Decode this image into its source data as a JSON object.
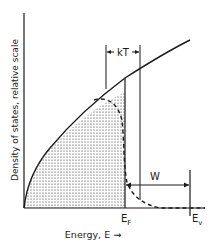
{
  "diagram": {
    "type": "density-of-states",
    "y_axis_label": "Density of states, relative scale",
    "x_axis_label": "Energy, E →",
    "markers": {
      "fermi": {
        "main": "E",
        "sub": "F"
      },
      "vacuum": {
        "main": "E",
        "sub": "v"
      }
    },
    "annotations": {
      "kT": "kT",
      "W": "W"
    },
    "curves": [
      {
        "name": "density-of-states",
        "style": "solid",
        "shape": "sqrt(E)"
      },
      {
        "name": "occupied-states",
        "style": "dashed",
        "shape": "Fermi-Dirac weighted"
      }
    ],
    "shaded_region": "occupied states below E_F (dotted fill)",
    "colors": {
      "ink": "#1a1a1a",
      "background": "#ffffff"
    }
  }
}
